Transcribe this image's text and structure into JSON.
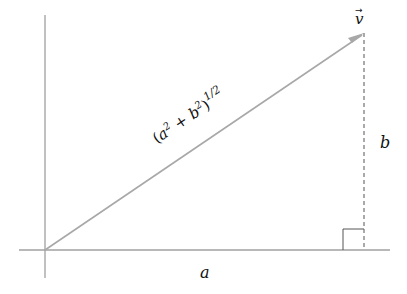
{
  "diagram": {
    "vector_label": "v⃗",
    "vector_arrow_glyph": "→",
    "vector_letter": "v",
    "hypotenuse_label": {
      "open": "(",
      "a": "a",
      "sup2a": "2",
      "plus": " + ",
      "b": "b",
      "sup2b": "2",
      "close": ")",
      "exponent": "1/2"
    },
    "horizontal_label": "a",
    "vertical_label": "b",
    "colors": {
      "axis": "#a0a0a0",
      "vector": "#a8a8a8",
      "dashed": "#555555",
      "right_angle": "#555555",
      "text": "#111111"
    },
    "geometry": {
      "origin": [
        45,
        250
      ],
      "tip": [
        364,
        33
      ]
    }
  }
}
